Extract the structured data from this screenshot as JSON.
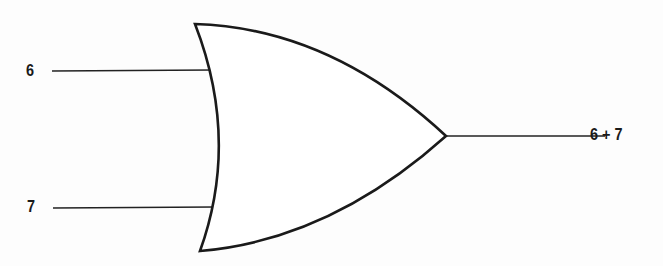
{
  "diagram": {
    "type": "logic-gate",
    "gate": "OR",
    "inputs": [
      {
        "label": "6"
      },
      {
        "label": "7"
      }
    ],
    "output": {
      "label": "6 + 7"
    },
    "colors": {
      "stroke": "#1a1a1a",
      "background": "#fdfdfd"
    }
  }
}
